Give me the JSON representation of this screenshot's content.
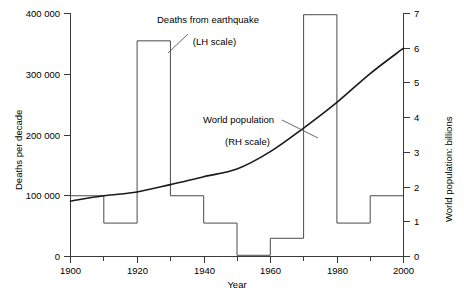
{
  "chart_data": {
    "type": "bar",
    "title": "",
    "xlabel": "Year",
    "ylabel": "Deaths per decade",
    "y2label": "World population: billions",
    "xlim": [
      1900,
      2000
    ],
    "ylim": [
      0,
      400000
    ],
    "y2lim": [
      0,
      7
    ],
    "grid": false,
    "legend": "annotations",
    "xticks": [
      1900,
      1920,
      1940,
      1960,
      1980,
      2000
    ],
    "xtick_labels": [
      "1900",
      "1920",
      "1940",
      "1960",
      "1980",
      "2000"
    ],
    "xminor_ticks": [
      1910,
      1930,
      1950,
      1970,
      1990
    ],
    "yticks": [
      0,
      100000,
      200000,
      300000,
      400000
    ],
    "ytick_labels": [
      "0",
      "100 000",
      "200 000",
      "300 000",
      "400 000"
    ],
    "y2ticks": [
      0,
      1,
      2,
      3,
      4,
      5,
      6,
      7
    ],
    "y2tick_labels": [
      "0",
      "1",
      "2",
      "3",
      "4",
      "5",
      "6",
      "7"
    ],
    "categories": [
      "1900-1910",
      "1910-1920",
      "1920-1930",
      "1930-1940",
      "1940-1950",
      "1950-1960",
      "1960-1970",
      "1970-1980",
      "1980-1990",
      "1990-2000"
    ],
    "bin_edges": [
      1900,
      1910,
      1920,
      1930,
      1940,
      1950,
      1960,
      1970,
      1980,
      1990,
      2000
    ],
    "series": [
      {
        "name": "Deaths from earthquake",
        "axis": "left",
        "style": "step-outline",
        "values": [
          100000,
          55000,
          355000,
          100000,
          55000,
          2000,
          30000,
          398000,
          55000,
          100000
        ]
      },
      {
        "name": "World population",
        "axis": "right",
        "style": "line",
        "x": [
          1900,
          1910,
          1920,
          1930,
          1940,
          1950,
          1960,
          1970,
          1980,
          1990,
          2000
        ],
        "values": [
          1.6,
          1.75,
          1.86,
          2.07,
          2.3,
          2.52,
          3.02,
          3.7,
          4.44,
          5.27,
          6.0
        ]
      }
    ],
    "annotations": [
      {
        "id": "deaths-annotation",
        "line1": "Deaths from earthquake",
        "line2": "(LH scale)"
      },
      {
        "id": "population-annotation",
        "line1": "World population",
        "line2": "(RH scale)"
      }
    ]
  }
}
